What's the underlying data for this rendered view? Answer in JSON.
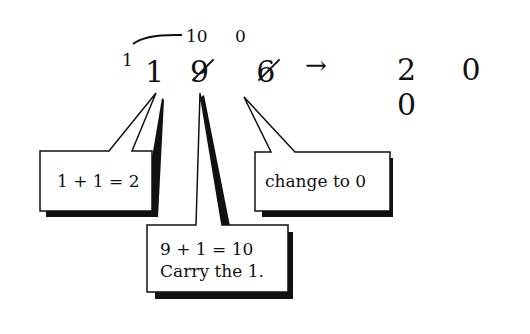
{
  "problem": {
    "carry_small": "1",
    "digits": [
      "1",
      "9",
      "6"
    ],
    "replacements": [
      "10",
      "0"
    ],
    "arrow": "→",
    "result": "2 0 0"
  },
  "callouts": [
    {
      "text": "1 + 1 = 2"
    },
    {
      "text": "change to 0"
    },
    {
      "line1": "9 + 1 = 10",
      "line2": "Carry the 1."
    }
  ]
}
